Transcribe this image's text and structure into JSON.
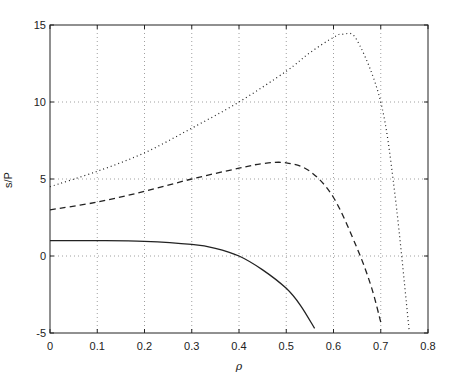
{
  "chart_data": {
    "type": "line",
    "title": "",
    "xlabel": "ρ",
    "ylabel": "s/P",
    "xlim": [
      0,
      0.8
    ],
    "ylim": [
      -5,
      15
    ],
    "grid": true,
    "xticks": [
      "0",
      "0.1",
      "0.2",
      "0.3",
      "0.4",
      "0.5",
      "0.6",
      "0.7",
      "0.8"
    ],
    "yticks": [
      "-5",
      "0",
      "5",
      "10",
      "15"
    ],
    "series": [
      {
        "name": "solid",
        "style": "solid",
        "x": [
          0,
          0.1,
          0.2,
          0.3,
          0.35,
          0.4,
          0.45,
          0.5,
          0.53,
          0.56
        ],
        "y": [
          1.0,
          1.0,
          0.95,
          0.75,
          0.5,
          0.0,
          -0.9,
          -2.1,
          -3.2,
          -4.7
        ]
      },
      {
        "name": "dashed",
        "style": "dashed",
        "x": [
          0,
          0.1,
          0.2,
          0.3,
          0.4,
          0.45,
          0.5,
          0.55,
          0.6,
          0.65,
          0.68,
          0.7
        ],
        "y": [
          3.0,
          3.5,
          4.2,
          5.0,
          5.7,
          6.0,
          6.05,
          5.5,
          3.8,
          0.5,
          -2.0,
          -4.3
        ]
      },
      {
        "name": "dotted",
        "style": "dotted",
        "x": [
          0,
          0.1,
          0.2,
          0.3,
          0.4,
          0.5,
          0.55,
          0.6,
          0.62,
          0.65,
          0.7,
          0.73,
          0.76
        ],
        "y": [
          4.5,
          5.5,
          6.7,
          8.3,
          10.0,
          12.0,
          13.2,
          14.2,
          14.4,
          14.0,
          10.0,
          4.0,
          -4.8
        ]
      }
    ]
  }
}
